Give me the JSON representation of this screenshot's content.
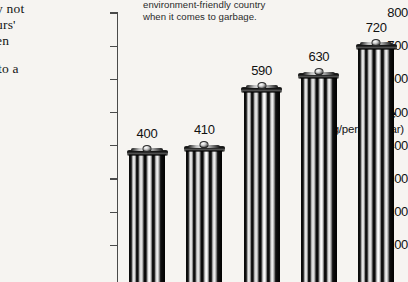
{
  "page": {
    "background_color": "#f6f4f1",
    "text_color": "#111111"
  },
  "article_text": {
    "line1": "y not",
    "line2": "urs'",
    "line3": "en",
    "line4": "to a"
  },
  "caption": {
    "line1": "environment-friendly country",
    "line2": "when it comes to garbage."
  },
  "chart_data": {
    "type": "bar",
    "title": "",
    "subtitle": "",
    "ylabel": "Waste",
    "ylabel_units": "(kg/person/year)",
    "xlabel": "",
    "ylim": [
      0,
      800
    ],
    "ytick_labels": [
      "800",
      "700",
      "600",
      "500",
      "400",
      "300",
      "200",
      "100"
    ],
    "ytick_values": [
      800,
      700,
      600,
      500,
      400,
      300,
      200,
      100
    ],
    "grid": false,
    "legend": "none",
    "categories": [
      "",
      "",
      "",
      "",
      ""
    ],
    "values": [
      400,
      410,
      590,
      630,
      720
    ],
    "data_labels": [
      "400",
      "410",
      "590",
      "630",
      "720"
    ],
    "bar_style": "garbage-can-pictogram",
    "bar_color": "#111111"
  }
}
